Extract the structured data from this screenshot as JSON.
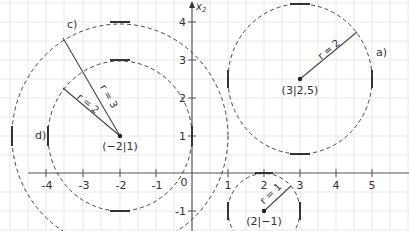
{
  "diagram": {
    "type": "coordinate-system-circles",
    "axes": {
      "x_label": "",
      "y_label": "x2",
      "x_ticks": [
        "-4",
        "-3",
        "-2",
        "-1",
        "1",
        "2",
        "3",
        "4",
        "5"
      ],
      "y_ticks": [
        "4",
        "3",
        "2",
        "1",
        "-1"
      ],
      "origin_label": "0"
    },
    "circles": [
      {
        "id": "a",
        "label": "a)",
        "center_label": "(3|2,5)",
        "radius_label": "r = 2",
        "cx": 3,
        "cy": 2.5,
        "r": 2
      },
      {
        "id": "b",
        "label": "",
        "center_label": "(2|−1)",
        "radius_label": "r = 1",
        "cx": 2,
        "cy": -1,
        "r": 1
      },
      {
        "id": "c",
        "label": "c)",
        "center_label": "(−2|1)",
        "radius_label": "r = 3",
        "cx": -2,
        "cy": 1,
        "r": 3
      },
      {
        "id": "d",
        "label": "d)",
        "center_label": "",
        "radius_label": "r = 2",
        "cx": -2,
        "cy": 1,
        "r": 2
      }
    ],
    "colors": {
      "grid": "#e6e6e6",
      "axis": "#555555",
      "circle": "#444444",
      "text": "#333333"
    }
  }
}
